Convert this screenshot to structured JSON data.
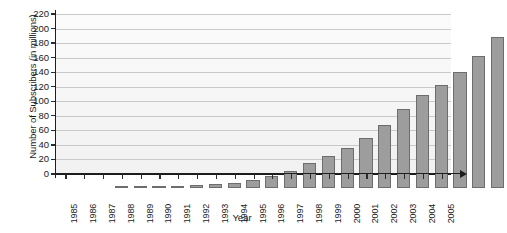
{
  "chart_data": {
    "type": "bar",
    "title": "",
    "xlabel": "Year",
    "ylabel": "Number of Subscribers (in millions)",
    "categories": [
      "1985",
      "1986",
      "1987",
      "1988",
      "1989",
      "1990",
      "1991",
      "1992",
      "1993",
      "1994",
      "1995",
      "1996",
      "1997",
      "1998",
      "1999",
      "2000",
      "2001",
      "2002",
      "2003",
      "2004",
      "2005"
    ],
    "values": [
      0.3,
      0.7,
      1.2,
      2,
      3.5,
      5,
      7.5,
      11,
      16,
      24,
      34,
      44,
      55,
      69,
      86,
      109,
      128,
      141,
      159,
      182,
      208
    ],
    "ylim": [
      0,
      220
    ],
    "ytick_values": [
      0,
      20,
      40,
      60,
      80,
      100,
      120,
      140,
      160,
      180,
      200,
      220
    ],
    "ytick_labels": [
      "0",
      "20",
      "40",
      "60",
      "80",
      "100",
      "120",
      "140",
      "160",
      "180",
      "200",
      "220"
    ],
    "grid": true,
    "legend": "none",
    "series_color": "#9d9d9d",
    "series_edge_color": "#6d6d6d",
    "axis_color": "#1f1f1f",
    "grid_color": "#c9c9c9",
    "plot_background": "#f4f4f4"
  }
}
